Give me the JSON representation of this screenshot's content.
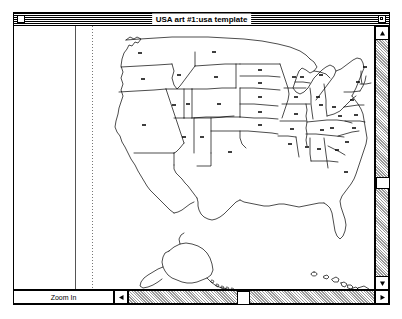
{
  "window": {
    "title": "USA art #1:usa template",
    "close_box_name": "close-box",
    "zoom_box_name": "zoom-box"
  },
  "toolbar": {
    "zoom_in_label": "Zoom In"
  },
  "scrollbars": {
    "vertical": {
      "thumb_position_percent": 57
    },
    "horizontal": {
      "thumb_position_percent": 62
    }
  },
  "canvas": {
    "document_name": "usa template",
    "guides": {
      "solid_line": true,
      "dotted_line": true
    }
  },
  "map": {
    "title": "United States map template",
    "regions": [
      "Continental United States",
      "Alaska",
      "Hawaii"
    ],
    "state_labels": [
      "WA",
      "OR",
      "CA",
      "NV",
      "ID",
      "MT",
      "WY",
      "UT",
      "AZ",
      "CO",
      "NM",
      "ND",
      "SD",
      "NE",
      "KS",
      "OK",
      "TX",
      "MN",
      "IA",
      "MO",
      "AR",
      "LA",
      "WI",
      "IL",
      "MS",
      "MI",
      "IN",
      "KY",
      "TN",
      "AL",
      "OH",
      "WV",
      "GA",
      "FL",
      "SC",
      "NC",
      "VA",
      "PA",
      "NY",
      "ME",
      "VT",
      "NH",
      "MA",
      "RI",
      "CT",
      "NJ",
      "DE",
      "MD",
      "AK",
      "HI"
    ]
  },
  "colors": {
    "window_background": "#ffffff",
    "border": "#000000",
    "scrollbar_track": "#9a9a9a",
    "map_stroke": "#000000"
  }
}
